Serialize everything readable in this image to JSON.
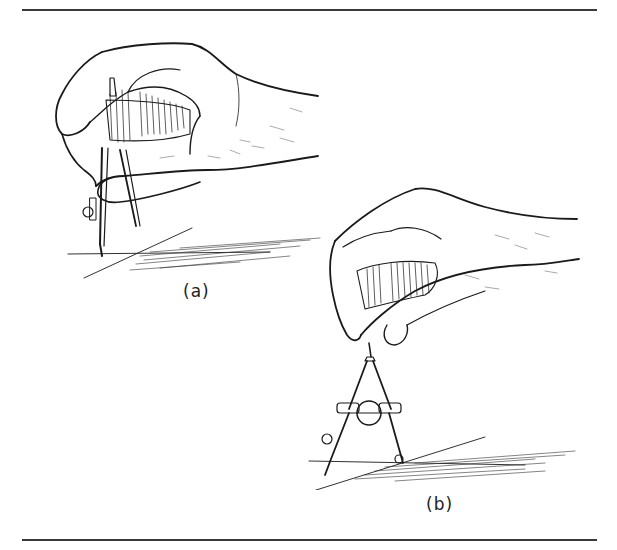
{
  "figure": {
    "panels": [
      {
        "id": "a",
        "caption": "(a)",
        "description": "Hand gripping compass from above with fingers wrapped around handle; compass points resting on a drawn line"
      },
      {
        "id": "b",
        "caption": "(b)",
        "description": "Hand pinching compass handle between thumb and index finger; bow compass with center adjusting wheel, points on a drawn line"
      }
    ]
  },
  "colors": {
    "ink": "#1a1a1a",
    "rule": "#3a3a3a",
    "background": "#ffffff"
  }
}
